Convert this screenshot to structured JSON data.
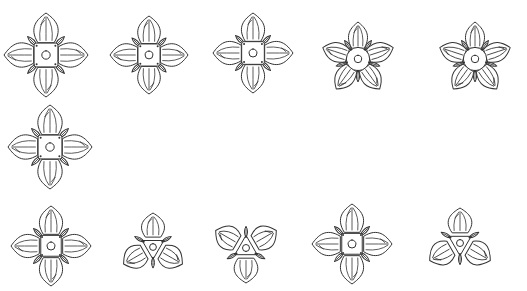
{
  "figure": {
    "background": "#ffffff",
    "stroke_color": "#333333",
    "flowers": [
      {
        "id": "f1",
        "cx": 46,
        "cy": 55,
        "petals": 4,
        "rot": 0,
        "size": 42,
        "center": "square"
      },
      {
        "id": "f2",
        "cx": 149,
        "cy": 55,
        "petals": 4,
        "rot": 0,
        "size": 39,
        "center": "square",
        "split_bottom": false
      },
      {
        "id": "f3",
        "cx": 253,
        "cy": 53,
        "petals": 4,
        "rot": 0,
        "size": 40,
        "center": "square",
        "split_bottom": true
      },
      {
        "id": "f4",
        "cx": 358,
        "cy": 59,
        "petals": 5,
        "rot": 0,
        "size": 37,
        "center": "round"
      },
      {
        "id": "f5",
        "cx": 475,
        "cy": 59,
        "petals": 5,
        "rot": 0,
        "size": 37,
        "center": "round"
      },
      {
        "id": "f6",
        "cx": 50,
        "cy": 147,
        "petals": 4,
        "rot": 0,
        "size": 42,
        "center": "square"
      },
      {
        "id": "f7",
        "cx": 51,
        "cy": 246,
        "petals": 4,
        "rot": 0,
        "size": 40,
        "center": "triangle"
      },
      {
        "id": "f8",
        "cx": 153,
        "cy": 247,
        "petals": 3,
        "rot": 0,
        "size": 34,
        "center": "triangle"
      },
      {
        "id": "f9",
        "cx": 246,
        "cy": 248,
        "petals": 3,
        "rot": 180,
        "size": 35,
        "center": "triangle"
      },
      {
        "id": "f10",
        "cx": 352,
        "cy": 244,
        "petals": 4,
        "rot": 0,
        "size": 40,
        "center": "triangle"
      },
      {
        "id": "f11",
        "cx": 460,
        "cy": 243,
        "petals": 3,
        "rot": 0,
        "size": 35,
        "center": "triangle"
      }
    ]
  }
}
